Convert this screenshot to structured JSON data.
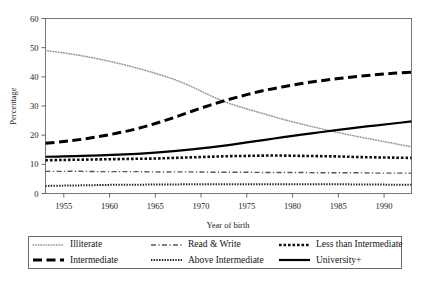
{
  "chart_data": {
    "type": "line",
    "title": "",
    "xlabel": "Year of birth",
    "ylabel": "Percentage",
    "xlim": [
      1953,
      1993
    ],
    "ylim": [
      0,
      60
    ],
    "xticks": [
      1955,
      1960,
      1965,
      1970,
      1975,
      1980,
      1985,
      1990
    ],
    "yticks": [
      0,
      10,
      20,
      30,
      40,
      50,
      60
    ],
    "grid": false,
    "legend_position": "below-axes",
    "x": [
      1953,
      1955,
      1957,
      1959,
      1961,
      1963,
      1965,
      1967,
      1969,
      1971,
      1973,
      1975,
      1977,
      1979,
      1981,
      1983,
      1985,
      1987,
      1989,
      1991,
      1993
    ],
    "series": [
      {
        "name": "Illiterate",
        "style": "fine-dotted",
        "color": "#9a9a9a",
        "values": [
          49.0,
          48.2,
          47.2,
          46.0,
          44.6,
          43.0,
          41.2,
          39.2,
          36.6,
          33.6,
          31.0,
          29.0,
          27.2,
          25.4,
          23.8,
          22.3,
          20.9,
          19.6,
          18.4,
          17.2,
          16.0
        ]
      },
      {
        "name": "Read & Write",
        "style": "dash-dot",
        "color": "#555555",
        "values": [
          7.6,
          7.6,
          7.6,
          7.5,
          7.5,
          7.5,
          7.4,
          7.4,
          7.4,
          7.3,
          7.3,
          7.3,
          7.2,
          7.2,
          7.2,
          7.1,
          7.1,
          7.1,
          7.0,
          7.0,
          7.0
        ]
      },
      {
        "name": "Less than Intermediate",
        "style": "thick-dotted",
        "color": "#111111",
        "values": [
          11.4,
          11.5,
          11.6,
          11.7,
          11.8,
          11.9,
          12.0,
          12.2,
          12.4,
          12.6,
          12.8,
          12.9,
          13.0,
          13.0,
          12.9,
          12.8,
          12.7,
          12.5,
          12.4,
          12.3,
          12.2
        ]
      },
      {
        "name": "Intermediate",
        "style": "long-dash",
        "color": "#000000",
        "values": [
          17.2,
          17.8,
          18.6,
          19.6,
          20.8,
          22.2,
          24.0,
          26.0,
          28.2,
          30.3,
          32.2,
          33.9,
          35.4,
          36.6,
          37.7,
          38.6,
          39.4,
          40.1,
          40.7,
          41.2,
          41.6
        ]
      },
      {
        "name": "Above Intermediate",
        "style": "dense-dotted",
        "color": "#222222",
        "values": [
          2.6,
          2.7,
          2.8,
          2.9,
          3.0,
          3.0,
          3.1,
          3.1,
          3.2,
          3.2,
          3.2,
          3.2,
          3.2,
          3.2,
          3.2,
          3.2,
          3.2,
          3.1,
          3.1,
          3.0,
          3.0
        ]
      },
      {
        "name": "University+",
        "style": "solid",
        "color": "#000000",
        "values": [
          12.6,
          12.7,
          12.9,
          13.1,
          13.3,
          13.6,
          14.0,
          14.5,
          15.1,
          15.8,
          16.6,
          17.5,
          18.4,
          19.3,
          20.2,
          21.0,
          21.8,
          22.6,
          23.3,
          24.0,
          24.7
        ]
      }
    ]
  },
  "axis": {
    "y_title": "Percentage",
    "x_title": "Year of birth",
    "y_ticks": [
      "0",
      "10",
      "20",
      "30",
      "40",
      "50",
      "60"
    ],
    "x_ticks": [
      "1955",
      "1960",
      "1965",
      "1970",
      "1975",
      "1980",
      "1985",
      "1990"
    ]
  },
  "legend": {
    "entries": [
      {
        "label": "Illiterate",
        "swatch": "fine-dotted-swatch"
      },
      {
        "label": "Read & Write",
        "swatch": "dash-dot-swatch"
      },
      {
        "label": "Less than Intermediate",
        "swatch": "thick-dotted-swatch"
      },
      {
        "label": "Intermediate",
        "swatch": "long-dash-swatch"
      },
      {
        "label": "Above Intermediate",
        "swatch": "dense-dotted-swatch"
      },
      {
        "label": "University+",
        "swatch": "solid-swatch"
      }
    ]
  },
  "caption": {
    "text": ""
  }
}
